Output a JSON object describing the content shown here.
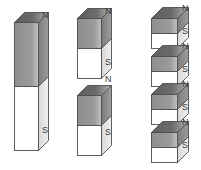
{
  "diagram": {
    "background_color": "#ffffff",
    "north_label": "N",
    "south_label": "S",
    "colors": {
      "north_face": "#9a9a9a",
      "south_face": "#ffffff",
      "top_face_dark": "#5e5e5e",
      "top_face_light": "#b5b5b5",
      "side_face_north": "#7c7c7c",
      "side_face_south": "#d8d8d8",
      "outline": "#4d4d4d",
      "label_text": "#3b3b3b"
    },
    "columns": [
      {
        "name": "column-one-whole-magnet",
        "count": 1,
        "magnets": [
          {
            "name": "magnet-whole",
            "x": 14,
            "y": 12,
            "width": 24,
            "height": 128,
            "depth": 10,
            "north_label": "N",
            "south_label": "S",
            "north_label_x": 42,
            "north_label_y": 11,
            "south_label_x": 42,
            "south_label_y": 126
          }
        ]
      },
      {
        "name": "column-two-halves",
        "count": 2,
        "magnets": [
          {
            "name": "magnet-half-top",
            "x": 77,
            "y": 8,
            "width": 24,
            "height": 60,
            "depth": 10,
            "north_label": "N",
            "south_label": "S",
            "north_label_x": 105,
            "north_label_y": 7,
            "south_label_x": 105,
            "south_label_y": 58
          },
          {
            "name": "magnet-half-bottom",
            "x": 77,
            "y": 85,
            "width": 24,
            "height": 60,
            "depth": 10,
            "north_label": "N",
            "south_label": "S",
            "north_label_x": 105,
            "north_label_y": 75,
            "south_label_x": 105,
            "south_label_y": 128
          }
        ]
      },
      {
        "name": "column-three-quarters",
        "count": 4,
        "magnets": [
          {
            "name": "magnet-quarter-1",
            "x": 151,
            "y": 7,
            "width": 26,
            "height": 30,
            "depth": 11,
            "north_label": "N",
            "south_label": "S",
            "north_label_x": 182,
            "north_label_y": 4,
            "south_label_x": 182,
            "south_label_y": 27
          },
          {
            "name": "magnet-quarter-2",
            "x": 151,
            "y": 45,
            "width": 26,
            "height": 30,
            "depth": 11,
            "north_label": "N",
            "south_label": "S",
            "north_label_x": 182,
            "north_label_y": 42,
            "south_label_x": 182,
            "south_label_y": 65
          },
          {
            "name": "magnet-quarter-3",
            "x": 151,
            "y": 83,
            "width": 26,
            "height": 30,
            "depth": 11,
            "north_label": "N",
            "south_label": "S",
            "north_label_x": 182,
            "north_label_y": 80,
            "south_label_x": 182,
            "south_label_y": 103
          },
          {
            "name": "magnet-quarter-4",
            "x": 151,
            "y": 121,
            "width": 26,
            "height": 30,
            "depth": 11,
            "north_label": "N",
            "south_label": "S",
            "north_label_x": 182,
            "north_label_y": 118,
            "south_label_x": 182,
            "south_label_y": 141
          }
        ]
      }
    ]
  }
}
